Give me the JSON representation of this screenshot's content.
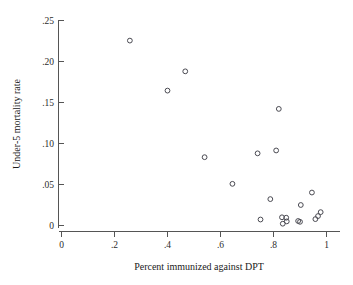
{
  "chart_data": {
    "type": "scatter",
    "title": "",
    "subtitle": "",
    "xlabel": "Percent immunized against DPT",
    "ylabel": "Under-5 mortality rate",
    "xlim": [
      0,
      1.05
    ],
    "ylim": [
      0,
      0.26
    ],
    "grid": false,
    "legend": null,
    "xticks": [
      0,
      0.2,
      0.4,
      0.6,
      0.8,
      1
    ],
    "xticklabels": [
      "0",
      ".2",
      ".4",
      ".6",
      ".8",
      "1"
    ],
    "yticks": [
      0,
      0.05,
      0.1,
      0.15,
      0.2,
      0.25
    ],
    "yticklabels": [
      "0",
      ".05",
      ".10",
      ".15",
      ".20",
      ".25"
    ],
    "marker": "open-circle",
    "marker_color": "#4a4a52",
    "points": [
      {
        "x": 0.258,
        "y": 0.2255
      },
      {
        "x": 0.4,
        "y": 0.1645
      },
      {
        "x": 0.467,
        "y": 0.188
      },
      {
        "x": 0.82,
        "y": 0.1422
      },
      {
        "x": 0.54,
        "y": 0.0833
      },
      {
        "x": 0.74,
        "y": 0.088
      },
      {
        "x": 0.81,
        "y": 0.0915
      },
      {
        "x": 0.645,
        "y": 0.0508
      },
      {
        "x": 0.945,
        "y": 0.0402
      },
      {
        "x": 0.788,
        "y": 0.0322
      },
      {
        "x": 0.903,
        "y": 0.025
      },
      {
        "x": 0.978,
        "y": 0.0163
      },
      {
        "x": 0.968,
        "y": 0.0115
      },
      {
        "x": 0.958,
        "y": 0.0078
      },
      {
        "x": 0.751,
        "y": 0.0073
      },
      {
        "x": 0.832,
        "y": 0.01
      },
      {
        "x": 0.848,
        "y": 0.0095
      },
      {
        "x": 0.835,
        "y": 0.0022
      },
      {
        "x": 0.85,
        "y": 0.005
      },
      {
        "x": 0.9,
        "y": 0.0045
      },
      {
        "x": 0.893,
        "y": 0.0055
      }
    ]
  },
  "axes": {
    "x_axis_name": "x-axis",
    "y_axis_name": "y-axis"
  }
}
